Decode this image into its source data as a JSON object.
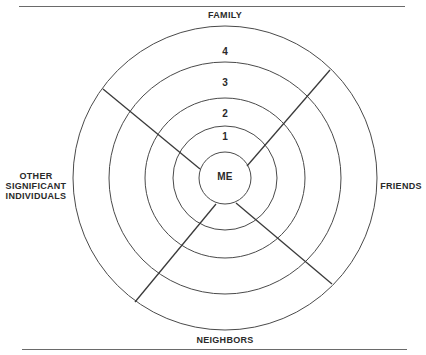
{
  "diagram": {
    "type": "concentric-circles-social-network",
    "center_label": "ME",
    "ring_labels": [
      "1",
      "2",
      "3",
      "4"
    ],
    "sectors": {
      "top": "FAMILY",
      "right": "FRIENDS",
      "bottom": "NEIGHBORS",
      "left_lines": [
        "OTHER",
        "SIGNIFICANT",
        "INDIVIDUALS"
      ]
    },
    "colors": {
      "stroke": "#4a4a4a",
      "text": "#2a2a2a",
      "background": "#ffffff"
    }
  }
}
